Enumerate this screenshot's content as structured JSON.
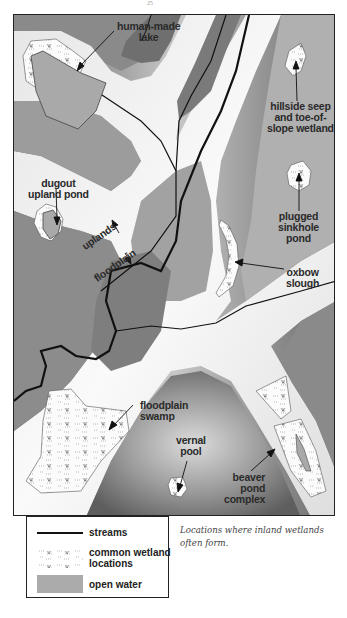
{
  "page": {
    "number": "25"
  },
  "figure": {
    "caption": "Locations where inland wetlands often form.",
    "colors": {
      "upland_dark": "#6e6e6e",
      "upland_mid": "#a8a8a8",
      "floodplain_light": "#f2f2f2",
      "stream": "#111111",
      "wetland_fill": "#f7f7f7",
      "open_water": "#a9a9a9"
    },
    "labels": {
      "human_made_lake": "human-made\nlake",
      "hillside_seep": "hillside seep\nand toe-of-\nslope wetland",
      "dugout_pond": "dugout\nupland pond",
      "plugged_sinkhole": "plugged\nsinkhole\npond",
      "oxbow_slough": "oxbow\nslough",
      "uplands": "uplands",
      "floodplain": "floodplain",
      "floodplain_swamp": "floodplain\nswamp",
      "vernal_pool": "vernal\npool",
      "beaver_pond": "beaver\npond\ncomplex"
    }
  },
  "legend": {
    "items": [
      {
        "label": "streams",
        "symbol": "stream-line"
      },
      {
        "label": "common wetland\nlocations",
        "symbol": "wetland-pattern"
      },
      {
        "label": "open water",
        "symbol": "open-water-swatch"
      }
    ]
  }
}
